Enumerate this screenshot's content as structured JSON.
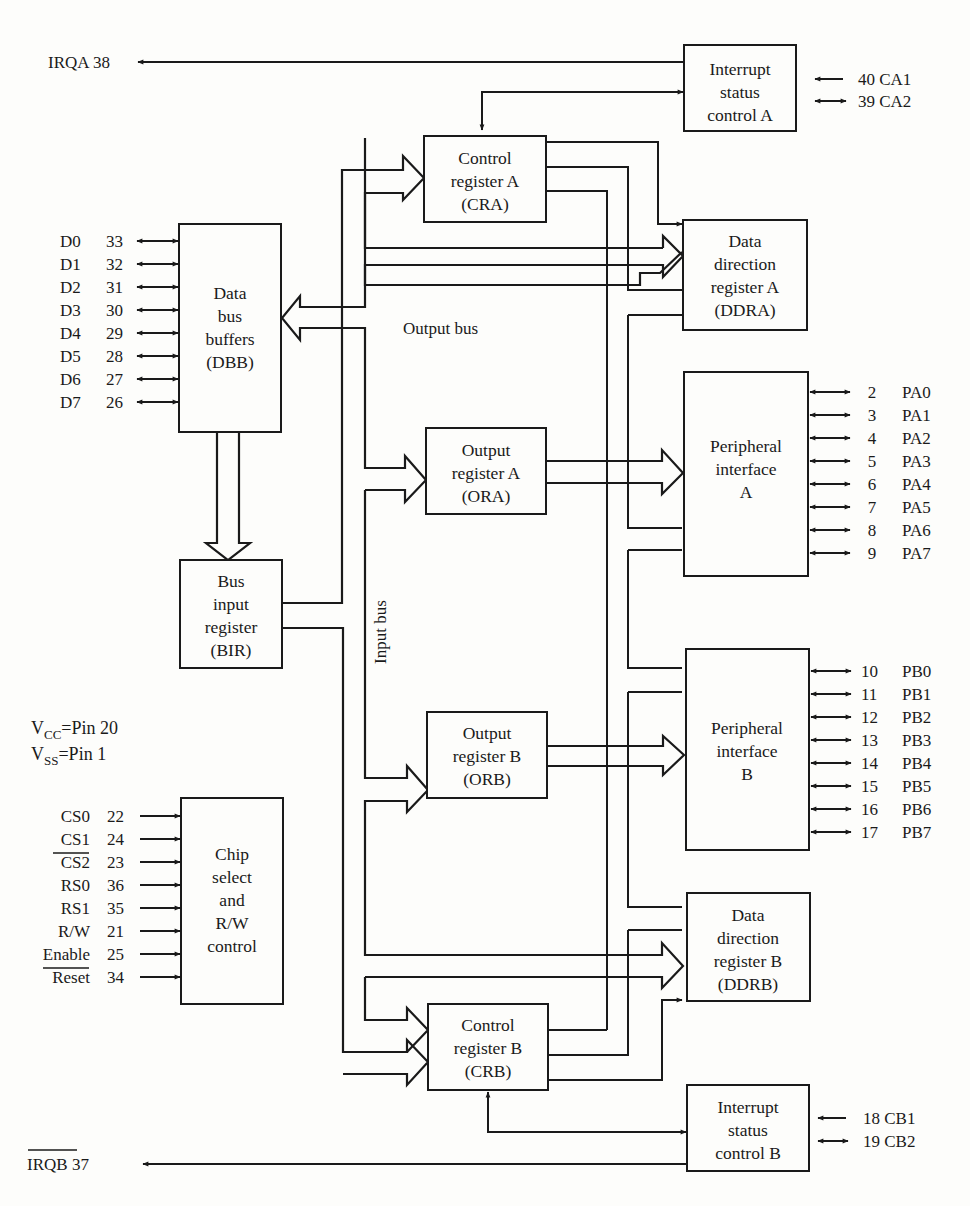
{
  "figure": {
    "colors": {
      "ink": "#1a1a1a",
      "paper": "#fdfdfb"
    }
  },
  "blocks": {
    "isca": {
      "lines": [
        "Interrupt",
        "status",
        "control A"
      ]
    },
    "cra": {
      "lines": [
        "Control",
        "register A",
        "(CRA)"
      ]
    },
    "ddra": {
      "lines": [
        "Data",
        "direction",
        "register A",
        "(DDRA)"
      ]
    },
    "dbb": {
      "lines": [
        "Data",
        "bus",
        "buffers",
        "(DBB)"
      ]
    },
    "ora": {
      "lines": [
        "Output",
        "register A",
        "(ORA)"
      ]
    },
    "pia": {
      "lines": [
        "Peripheral",
        "interface",
        "A"
      ]
    },
    "bir": {
      "lines": [
        "Bus",
        "input",
        "register",
        "(BIR)"
      ]
    },
    "orb": {
      "lines": [
        "Output",
        "register B",
        "(ORB)"
      ]
    },
    "pib": {
      "lines": [
        "Peripheral",
        "interface",
        "B"
      ]
    },
    "chip": {
      "lines": [
        "Chip",
        "select",
        "and",
        "R/W",
        "control"
      ]
    },
    "ddrb": {
      "lines": [
        "Data",
        "direction",
        "register B",
        "(DDRB)"
      ]
    },
    "crb": {
      "lines": [
        "Control",
        "register B",
        "(CRB)"
      ]
    },
    "iscb": {
      "lines": [
        "Interrupt",
        "status",
        "control B"
      ]
    }
  },
  "bus_labels": {
    "output_bus": "Output bus",
    "input_bus": "Input bus"
  },
  "interrupts": {
    "irqa": {
      "name": "IRQA",
      "pin": "38"
    },
    "irqb": {
      "name": "IRQB",
      "pin": "37",
      "active_low": true
    },
    "ca1": {
      "pin": "40",
      "name": "CA1"
    },
    "ca2": {
      "pin": "39",
      "name": "CA2"
    },
    "cb1": {
      "pin": "18",
      "name": "CB1"
    },
    "cb2": {
      "pin": "19",
      "name": "CB2"
    }
  },
  "power": {
    "vcc": {
      "sym": "V",
      "sub": "CC",
      "text": "=Pin 20"
    },
    "vss": {
      "sym": "V",
      "sub": "SS",
      "text": "=Pin 1"
    }
  },
  "data_pins": [
    {
      "name": "D0",
      "pin": "33"
    },
    {
      "name": "D1",
      "pin": "32"
    },
    {
      "name": "D2",
      "pin": "31"
    },
    {
      "name": "D3",
      "pin": "30"
    },
    {
      "name": "D4",
      "pin": "29"
    },
    {
      "name": "D5",
      "pin": "28"
    },
    {
      "name": "D6",
      "pin": "27"
    },
    {
      "name": "D7",
      "pin": "26"
    }
  ],
  "control_pins": [
    {
      "name": "CS0",
      "pin": "22",
      "overline": false
    },
    {
      "name": "CS1",
      "pin": "24",
      "overline": false
    },
    {
      "name": "CS2",
      "pin": "23",
      "overline": true
    },
    {
      "name": "RS0",
      "pin": "36",
      "overline": false
    },
    {
      "name": "RS1",
      "pin": "35",
      "overline": false
    },
    {
      "name": "R/W",
      "pin": "21",
      "overline": false
    },
    {
      "name": "Enable",
      "pin": "25",
      "overline": false
    },
    {
      "name": "Reset",
      "pin": "34",
      "overline": true
    }
  ],
  "port_a_pins": [
    {
      "pin": "2",
      "name": "PA0"
    },
    {
      "pin": "3",
      "name": "PA1"
    },
    {
      "pin": "4",
      "name": "PA2"
    },
    {
      "pin": "5",
      "name": "PA3"
    },
    {
      "pin": "6",
      "name": "PA4"
    },
    {
      "pin": "7",
      "name": "PA5"
    },
    {
      "pin": "8",
      "name": "PA6"
    },
    {
      "pin": "9",
      "name": "PA7"
    }
  ],
  "port_b_pins": [
    {
      "pin": "10",
      "name": "PB0"
    },
    {
      "pin": "11",
      "name": "PB1"
    },
    {
      "pin": "12",
      "name": "PB2"
    },
    {
      "pin": "13",
      "name": "PB3"
    },
    {
      "pin": "14",
      "name": "PB4"
    },
    {
      "pin": "15",
      "name": "PB5"
    },
    {
      "pin": "16",
      "name": "PB6"
    },
    {
      "pin": "17",
      "name": "PB7"
    }
  ]
}
